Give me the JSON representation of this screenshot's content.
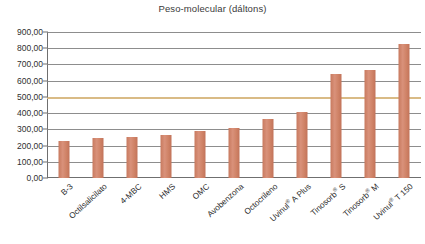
{
  "chart_data": {
    "type": "bar",
    "title": "Peso-molecular (dáltons)",
    "xlabel": "",
    "ylabel": "",
    "ylim": [
      0,
      900
    ],
    "ytick_step": 100,
    "grid": true,
    "legend": "none",
    "highlight_line": {
      "value": 500,
      "color": "#d9bb86",
      "label": ""
    },
    "bar_color": "#cf8266",
    "categories": [
      "B-3",
      "Octilsalicilato",
      "4-MBC",
      "HMS",
      "OMC",
      "Avobenzona",
      "Octocrileno",
      "Uvinul® A Plus",
      "Tinosorb® S",
      "Tinosorb® M",
      "Uvinul® T 150"
    ],
    "values": [
      229,
      250,
      255,
      264,
      290,
      310,
      361,
      405,
      640,
      664,
      823
    ],
    "ytick_labels": [
      "900,00",
      "800,00",
      "700,00",
      "600,00",
      "500,00",
      "400,00",
      "300,00",
      "200,00",
      "100,00",
      "0,00"
    ],
    "ytick_values": [
      900,
      800,
      700,
      600,
      500,
      400,
      300,
      200,
      100,
      0
    ]
  }
}
